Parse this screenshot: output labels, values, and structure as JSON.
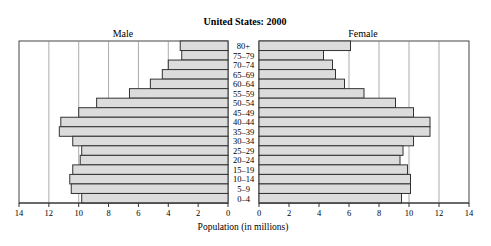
{
  "chart_data": {
    "type": "bar",
    "subtype": "population-pyramid",
    "title": "United States: 2000",
    "xlabel": "Population (in millions)",
    "ylabel": "",
    "panel_labels": {
      "left": "Male",
      "right": "Female"
    },
    "categories": [
      "80+",
      "75–79",
      "70–74",
      "65–69",
      "60–64",
      "55–59",
      "50–54",
      "45–49",
      "40–44",
      "35–39",
      "30–34",
      "25–29",
      "20–24",
      "15–19",
      "10–14",
      "5–9",
      "0–4"
    ],
    "series": [
      {
        "name": "Male",
        "values": [
          3.2,
          3.1,
          4.0,
          4.4,
          5.2,
          6.6,
          8.8,
          10.0,
          11.2,
          11.3,
          10.4,
          9.8,
          9.9,
          10.4,
          10.6,
          10.5,
          9.8
        ]
      },
      {
        "name": "Female",
        "values": [
          6.1,
          4.3,
          4.9,
          5.1,
          5.7,
          7.0,
          9.1,
          10.3,
          11.4,
          11.4,
          10.3,
          9.6,
          9.4,
          9.9,
          10.1,
          10.1,
          9.5
        ]
      }
    ],
    "xlim": [
      0,
      14
    ],
    "male_ticks": [
      "14",
      "12",
      "10",
      "8",
      "6",
      "4",
      "2",
      "0"
    ],
    "female_ticks": [
      "0",
      "2",
      "4",
      "6",
      "8",
      "10",
      "12",
      "14"
    ],
    "tick_values": [
      0,
      2,
      4,
      6,
      8,
      10,
      12,
      14
    ],
    "grid": true,
    "legend": "none",
    "bar_color": "#dcdcdc",
    "bar_edge_color": "#333333",
    "grid_color": "#888888"
  }
}
